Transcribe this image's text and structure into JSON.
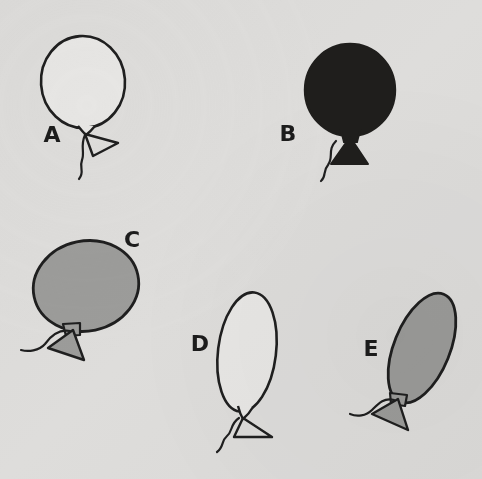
{
  "figure": {
    "background_color": "#dedddb",
    "ink_color": "#1f1f1f",
    "width": 482,
    "height": 479
  },
  "balloons": [
    {
      "id": "a",
      "label": "A",
      "fill": "white",
      "fill_color": "#e6e5e3",
      "shape": "circle",
      "orientation": "upright",
      "size": "large",
      "label_x": 52,
      "label_y": 142,
      "body": {
        "cx": 83,
        "cy": 82,
        "rx": 42,
        "ry": 46,
        "rotate": -4
      },
      "knot": {
        "x": 86,
        "y": 128
      },
      "tail": "triangle-outline-right",
      "string": "wavy-down-left"
    },
    {
      "id": "b",
      "label": "B",
      "fill": "dark",
      "fill_color": "#1f1e1c",
      "shape": "circle",
      "orientation": "upright",
      "size": "large",
      "label_x": 288,
      "label_y": 141,
      "body": {
        "cx": 350,
        "cy": 90,
        "rx": 45,
        "ry": 46,
        "rotate": 0
      },
      "knot": {
        "x": 350,
        "y": 136
      },
      "tail": "triangle-filled-left",
      "string": "wavy-down-left"
    },
    {
      "id": "c",
      "label": "C",
      "fill": "gray",
      "fill_color": "#9c9c9a",
      "shape": "ellipse-wide",
      "orientation": "tilted-left",
      "size": "large",
      "label_x": 122,
      "label_y": 247,
      "body": {
        "cx": 86,
        "cy": 286,
        "rx": 53,
        "ry": 45,
        "rotate": -12
      },
      "knot": {
        "x": 72,
        "y": 330
      },
      "tail": "triangle-filled-gray-right",
      "string": "wavy-left"
    },
    {
      "id": "d",
      "label": "D",
      "fill": "white",
      "fill_color": "#e6e5e3",
      "shape": "ellipse-tall",
      "orientation": "tilted-right",
      "size": "medium",
      "label_x": 198,
      "label_y": 350,
      "body": {
        "cx": 247,
        "cy": 352,
        "rx": 29,
        "ry": 60,
        "rotate": 7
      },
      "knot": {
        "x": 240,
        "y": 411
      },
      "tail": "triangle-outline-right",
      "string": "wavy-down-left"
    },
    {
      "id": "e",
      "label": "E",
      "fill": "gray",
      "fill_color": "#9c9c9a",
      "shape": "ellipse-tall",
      "orientation": "tilted-right",
      "size": "medium",
      "label_x": 369,
      "label_y": 355,
      "body": {
        "cx": 422,
        "cy": 348,
        "rx": 28,
        "ry": 58,
        "rotate": 22
      },
      "knot": {
        "x": 394,
        "y": 400
      },
      "tail": "triangle-filled-gray-left",
      "string": "wavy-left"
    }
  ]
}
